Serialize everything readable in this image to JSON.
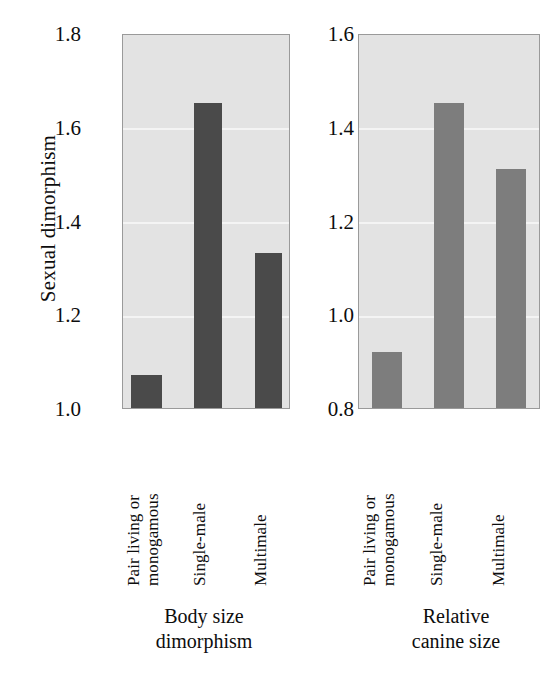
{
  "figure": {
    "y_axis_title": "Sexual dimorphism",
    "background_color": "#ffffff",
    "plot_background_color": "#e3e3e3",
    "gridline_color": "#f4f4f4",
    "axis_border_color": "#9a9a9a"
  },
  "panels": [
    {
      "id": "left",
      "caption": "Body size\ndimorphism",
      "bar_color": "#4a4a4a",
      "ylim": [
        1.0,
        1.8
      ],
      "ticks": [
        "1.8",
        "1.6",
        "1.4",
        "1.2",
        "1.0"
      ],
      "tick_values": [
        1.8,
        1.6,
        1.4,
        1.2,
        1.0
      ],
      "categories": [
        "Pair living or\nmonogamous",
        "Single-male",
        "Multimale"
      ],
      "values": [
        1.07,
        1.65,
        1.33
      ]
    },
    {
      "id": "right",
      "caption": "Relative\ncanine size",
      "bar_color": "#7d7d7d",
      "ylim": [
        0.8,
        1.6
      ],
      "ticks": [
        "1.6",
        "1.4",
        "1.2",
        "1.0",
        "0.8"
      ],
      "tick_values": [
        1.6,
        1.4,
        1.2,
        1.0,
        0.8
      ],
      "categories": [
        "Pair living or\nmonogamous",
        "Single-male",
        "Multimale"
      ],
      "values": [
        0.92,
        1.45,
        1.31
      ]
    }
  ],
  "chart_data": {
    "type": "bar",
    "title": "",
    "xlabel": "",
    "ylabel": "Sexual dimorphism",
    "grid": true,
    "legend": "none",
    "categories": [
      "Pair living or monogamous",
      "Single-male",
      "Multimale"
    ],
    "panels": [
      {
        "name": "Body size dimorphism",
        "ylabel": "Sexual dimorphism",
        "ylim": [
          1.0,
          1.8
        ],
        "yticks": [
          1.0,
          1.2,
          1.4,
          1.6,
          1.8
        ],
        "values": [
          1.07,
          1.65,
          1.33
        ],
        "bar_color": "#4a4a4a"
      },
      {
        "name": "Relative canine size",
        "ylabel": "Sexual dimorphism",
        "ylim": [
          0.8,
          1.6
        ],
        "yticks": [
          0.8,
          1.0,
          1.2,
          1.4,
          1.6
        ],
        "values": [
          0.92,
          1.45,
          1.31
        ],
        "bar_color": "#7d7d7d"
      }
    ]
  }
}
